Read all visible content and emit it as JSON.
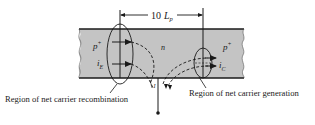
{
  "diagram": {
    "dimension": {
      "value": "10",
      "symbol": "L",
      "subscript": "p"
    },
    "regions": {
      "left": {
        "label": "p",
        "superscript": "+"
      },
      "middle": {
        "label": "n"
      },
      "right": {
        "label": "p",
        "superscript": "+"
      }
    },
    "currents": {
      "emitter": {
        "symbol": "i",
        "subscript": "E"
      },
      "collector": {
        "symbol": "i",
        "subscript": "C"
      },
      "base": {
        "symbol": "I"
      }
    },
    "captions": {
      "recombination": "Region of net carrier recombination",
      "generation": "Region of net carrier generation"
    },
    "colors": {
      "semiconductor": "#c4c4c4",
      "outline": "#1a1a1a"
    }
  }
}
